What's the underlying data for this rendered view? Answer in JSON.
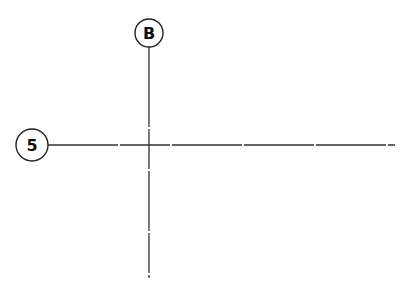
{
  "diagram": {
    "type": "structural-grid",
    "line_color": "#333333",
    "gridlines": [
      {
        "id": "grid-b",
        "orientation": "vertical",
        "label": "B",
        "x": 149,
        "y1": 47,
        "y2": 278,
        "bubble": {
          "cx": 149,
          "cy": 33,
          "r": 14
        }
      },
      {
        "id": "grid-5",
        "orientation": "horizontal",
        "label": "5",
        "y": 145,
        "x1": 48,
        "x2": 395,
        "bubble": {
          "cx": 32,
          "cy": 145,
          "r": 16
        }
      }
    ]
  }
}
